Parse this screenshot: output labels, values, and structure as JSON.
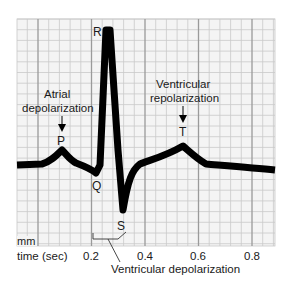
{
  "diagram": {
    "grid": {
      "x0": 17,
      "y0": 19,
      "x1": 275,
      "y1": 246,
      "minor_spacing_px": 10.7,
      "major_every": 5,
      "minor_color": "#c9c9c9",
      "major_color": "#9a9a9a",
      "background": "#f4f4f4"
    },
    "axis": {
      "unit_label": "mm",
      "x_label": "time (sec)",
      "ticks": [
        {
          "label": "0.2",
          "x": 91
        },
        {
          "label": "0.4",
          "x": 145
        },
        {
          "label": "0.6",
          "x": 198
        },
        {
          "label": "0.8",
          "x": 252
        }
      ]
    },
    "waves": {
      "P": "P",
      "Q": "Q",
      "R": "R",
      "S": "S",
      "T": "T"
    },
    "annotations": {
      "atrial_line1": "Atrial",
      "atrial_line2": "depolarization",
      "ventricular_repol_line1": "Ventricular",
      "ventricular_repol_line2": "repolarization",
      "ventricular_depol": "Ventricular depolarization"
    },
    "trace_color": "#000000"
  }
}
